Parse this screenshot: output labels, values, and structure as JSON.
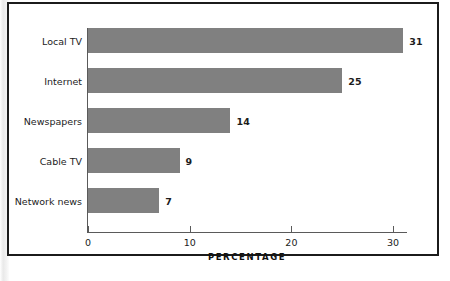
{
  "chart_data": {
    "type": "bar",
    "orientation": "horizontal",
    "title": "",
    "subtitle": "",
    "categories": [
      "Local TV",
      "Internet",
      "Newspapers",
      "Cable TV",
      "Network news"
    ],
    "values": [
      31,
      25,
      14,
      9,
      7
    ],
    "value_labels": [
      "31",
      "25",
      "14",
      "9",
      "7"
    ],
    "xlabel": "PERCENTAGE",
    "ylabel": "",
    "xlim": [
      0,
      31.5
    ],
    "xticks": [
      0,
      10,
      20,
      30
    ],
    "xtick_labels": [
      "0",
      "10",
      "20",
      "30"
    ],
    "grid": false,
    "legend": null,
    "series": [
      {
        "name": "Percentage",
        "values": [
          31,
          25,
          14,
          9,
          7
        ]
      }
    ]
  },
  "colors": {
    "bar_fill": "#808080",
    "axis_line": "#5a5a5a",
    "text": "#1c1c1c",
    "frame_border": "#1b1b1b",
    "background": "#ffffff"
  }
}
